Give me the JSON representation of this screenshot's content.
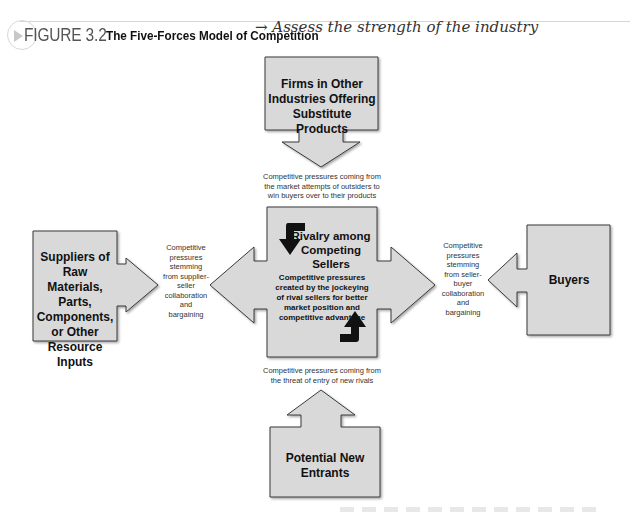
{
  "figure": {
    "label": "FIGURE 3.2",
    "title": "The Five-Forces Model of Competition",
    "handwritten_note": "→ Assess the strength of the industry"
  },
  "forces": {
    "substitutes": {
      "label": "Firms in Other Industries Offering Substitute Products"
    },
    "suppliers": {
      "label": "Suppliers of Raw Materials, Parts, Components, or Other Resource Inputs"
    },
    "rivalry": {
      "title": "Rivalry among Competing Sellers",
      "subtitle": "Competitive pressures created by the jockeying of rival sellers for better market position and competitive advantage"
    },
    "buyers": {
      "label": "Buyers"
    },
    "new_entrants": {
      "label": "Potential New Entrants"
    }
  },
  "pressures": {
    "from_substitutes": "Competitive pressures coming from the market attempts of outsiders to win buyers over to their products",
    "from_suppliers": "Competitive pressures stemming from supplier-seller collaboration and bargaining",
    "from_buyers": "Competitive pressures stemming from seller-buyer collaboration and bargaining",
    "from_new_entrants": "Competitive pressures coming from the threat of entry of new rivals"
  },
  "colors": {
    "box_fill": "#d9d9d9",
    "box_stroke": "#3a3a3a",
    "curved_arrow": "#111111"
  }
}
